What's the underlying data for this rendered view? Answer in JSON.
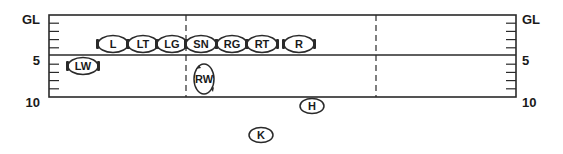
{
  "diagram": {
    "title": "",
    "yard_labels": {
      "left": [
        {
          "text": "GL",
          "y": 19
        },
        {
          "text": "5",
          "y": 60
        },
        {
          "text": "10",
          "y": 102
        }
      ],
      "right": [
        {
          "text": "GL",
          "y": 19
        },
        {
          "text": "5",
          "y": 60
        },
        {
          "text": "10",
          "y": 102
        }
      ]
    },
    "field": {
      "left": 49,
      "right": 516,
      "top": 15,
      "bottom": 97,
      "scrimmage_y": 55,
      "dashed_x": [
        186,
        376
      ],
      "line_color": "#2a2a2a"
    },
    "players": [
      {
        "label": "L",
        "x": 113,
        "y": 44,
        "w": 30,
        "h": 17,
        "blocks": "both"
      },
      {
        "label": "LT",
        "x": 143,
        "y": 44,
        "w": 30,
        "h": 17,
        "blocks": "both"
      },
      {
        "label": "LG",
        "x": 172,
        "y": 44,
        "w": 30,
        "h": 17,
        "blocks": "both"
      },
      {
        "label": "SN",
        "x": 201,
        "y": 44,
        "w": 30,
        "h": 17,
        "blocks": "both"
      },
      {
        "label": "RG",
        "x": 232,
        "y": 44,
        "w": 30,
        "h": 17,
        "blocks": "both"
      },
      {
        "label": "RT",
        "x": 262,
        "y": 44,
        "w": 30,
        "h": 17,
        "blocks": "both"
      },
      {
        "label": "R",
        "x": 299,
        "y": 44,
        "w": 30,
        "h": 17,
        "blocks": "both"
      },
      {
        "label": "LW",
        "x": 83,
        "y": 66,
        "w": 30,
        "h": 17,
        "blocks": "both"
      },
      {
        "label": "RW",
        "x": 204,
        "y": 79,
        "w": 20,
        "h": 30,
        "blocks": "rotated"
      },
      {
        "label": "H",
        "x": 312,
        "y": 106,
        "w": 24,
        "h": 15,
        "blocks": "none"
      },
      {
        "label": "K",
        "x": 261,
        "y": 135,
        "w": 24,
        "h": 15,
        "blocks": "none"
      }
    ]
  }
}
